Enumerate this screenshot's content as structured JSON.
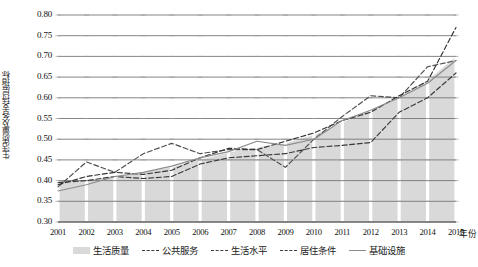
{
  "chart_data": {
    "type": "line",
    "title": "",
    "xlabel": "年份",
    "ylabel": "生活质量及各支持层指标",
    "categories": [
      "2001",
      "2002",
      "2003",
      "2004",
      "2005",
      "2006",
      "2007",
      "2008",
      "2009",
      "2010",
      "2011",
      "2012",
      "2013",
      "2014",
      "2015"
    ],
    "ylim": [
      0.3,
      0.8
    ],
    "ytick_step": 0.05,
    "yticks": [
      "0.80",
      "0.75",
      "0.70",
      "0.65",
      "0.60",
      "0.55",
      "0.50",
      "0.45",
      "0.40",
      "0.35",
      "0.30"
    ],
    "grid": "horizontal",
    "legend_position": "bottom",
    "series": [
      {
        "name": "生活质量",
        "style": "area",
        "color": "#d9d9d9",
        "values": [
          0.4,
          0.4,
          0.41,
          0.42,
          0.432,
          0.45,
          0.468,
          0.48,
          0.49,
          0.51,
          0.54,
          0.572,
          0.602,
          0.642,
          0.7
        ]
      },
      {
        "name": "公共服务",
        "style": "dashed",
        "color": "#4d4d4d",
        "values": [
          0.385,
          0.445,
          0.42,
          0.465,
          0.49,
          0.465,
          0.475,
          0.475,
          0.432,
          0.5,
          0.555,
          0.605,
          0.6,
          0.675,
          0.69
        ]
      },
      {
        "name": "生活水平",
        "style": "dashed",
        "color": "#333333",
        "values": [
          0.39,
          0.41,
          0.42,
          0.415,
          0.425,
          0.455,
          0.478,
          0.475,
          0.495,
          0.515,
          0.545,
          0.565,
          0.605,
          0.64,
          0.77
        ]
      },
      {
        "name": "居住条件",
        "style": "dashed",
        "color": "#3a3a3a",
        "values": [
          0.395,
          0.4,
          0.41,
          0.405,
          0.41,
          0.44,
          0.455,
          0.46,
          0.465,
          0.48,
          0.485,
          0.492,
          0.565,
          0.6,
          0.66
        ]
      },
      {
        "name": "基础设施",
        "style": "solid",
        "color": "#8c8c8c",
        "values": [
          0.375,
          0.39,
          0.41,
          0.42,
          0.435,
          0.455,
          0.47,
          0.495,
          0.485,
          0.5,
          0.545,
          0.57,
          0.6,
          0.635,
          0.69
        ]
      }
    ]
  },
  "legend": {
    "items": [
      {
        "label": "生活质量",
        "marker": "area"
      },
      {
        "label": "公共服务",
        "marker": "dashed"
      },
      {
        "label": "生活水平",
        "marker": "dashed"
      },
      {
        "label": "居住条件",
        "marker": "dashed"
      },
      {
        "label": "基础设施",
        "marker": "solid"
      }
    ]
  }
}
